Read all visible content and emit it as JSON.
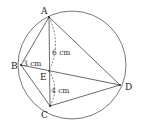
{
  "figure": {
    "type": "cyclic quadrilateral with intersecting chords",
    "points": {
      "A": "A",
      "B": "B",
      "C": "C",
      "D": "D",
      "E": "E"
    },
    "segments": [
      "AB",
      "BC",
      "CD",
      "DA",
      "AC",
      "BD"
    ],
    "measurements": {
      "AE": "6 cm",
      "BE": "3 cm",
      "EC": "4 cm"
    }
  }
}
